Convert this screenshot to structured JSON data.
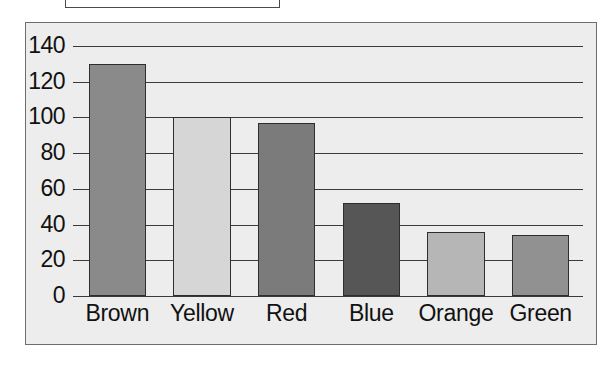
{
  "top_box": {
    "label": "",
    "note": "empty bordered box, clipped by top edge of screenshot"
  },
  "chart_data": {
    "type": "bar",
    "title": "",
    "xlabel": "",
    "ylabel": "",
    "categories": [
      "Brown",
      "Yellow",
      "Red",
      "Blue",
      "Orange",
      "Green"
    ],
    "values": [
      130,
      100,
      97,
      52,
      36,
      34
    ],
    "ylim": [
      0,
      140
    ],
    "yticks": [
      0,
      20,
      40,
      60,
      80,
      100,
      120,
      140
    ],
    "ytick_labels": [
      "0",
      "20",
      "40",
      "60",
      "80",
      "100",
      "120",
      "140"
    ],
    "grid": true,
    "legend": "none",
    "bar_colors": [
      "#8a8a8a",
      "#d6d6d6",
      "#7b7b7b",
      "#565656",
      "#b6b6b6",
      "#919191"
    ],
    "bar_edge_color": "#2e2e2e",
    "plot_background": "#ededed",
    "frame_color": "#6d6d6d",
    "gridline_color": "#3a3a3a",
    "text_color": "#111111"
  }
}
